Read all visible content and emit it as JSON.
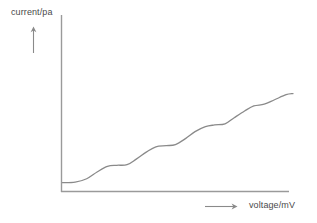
{
  "chart_data": {
    "type": "line",
    "title": "",
    "subtitle": "",
    "xlabel": "voltage/mV",
    "ylabel": "current/pa",
    "grid": false,
    "legend": null,
    "axis_style": "open-corner-arrows",
    "annotations": [
      {
        "name": "y-axis-direction-arrow",
        "direction": "up"
      },
      {
        "name": "x-axis-direction-arrow",
        "direction": "right"
      }
    ],
    "xlim": [
      0,
      10
    ],
    "ylim": [
      0,
      10
    ],
    "tick_labels": {
      "x": [],
      "y": []
    },
    "series": [
      {
        "name": "current",
        "color": "#8a8a8a",
        "x": [
          0.0,
          0.55,
          1.05,
          1.5,
          1.95,
          2.35,
          2.8,
          3.2,
          3.65,
          4.05,
          4.5,
          4.9,
          5.35,
          5.75,
          6.2,
          6.6,
          7.05,
          7.45,
          7.9,
          8.3,
          8.75,
          9.2,
          9.7,
          10.0
        ],
        "y": [
          0.3,
          0.35,
          0.65,
          1.25,
          1.75,
          1.85,
          1.9,
          2.4,
          3.05,
          3.5,
          3.6,
          3.7,
          4.25,
          4.85,
          5.3,
          5.45,
          5.55,
          6.1,
          6.7,
          7.15,
          7.3,
          7.7,
          8.15,
          8.25
        ]
      }
    ],
    "steps": [
      {
        "plateau_index": 1,
        "plateau_level": 1.88
      },
      {
        "plateau_index": 2,
        "plateau_level": 3.62
      },
      {
        "plateau_index": 3,
        "plateau_level": 5.48
      },
      {
        "plateau_index": 4,
        "plateau_level": 7.28
      },
      {
        "plateau_index": 5,
        "plateau_level": 8.25
      }
    ]
  },
  "colors": {
    "background": "#ffffff",
    "axis": "#9a9a9a",
    "curve": "#8a8a8a",
    "text": "#4a4a4a"
  }
}
